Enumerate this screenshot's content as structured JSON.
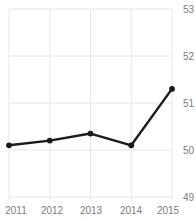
{
  "chart_data": {
    "type": "line",
    "title": "",
    "xlabel": "",
    "ylabel": "",
    "categories": [
      "2011",
      "2012",
      "2013",
      "2014",
      "2015"
    ],
    "x": [
      2011,
      2012,
      2013,
      2014,
      2015
    ],
    "values": [
      50.1,
      50.2,
      50.35,
      50.1,
      51.3
    ],
    "series": [
      {
        "name": "series-1",
        "values": [
          50.1,
          50.2,
          50.35,
          50.1,
          51.3
        ],
        "color": "#1a1a1a",
        "marker": "circle",
        "line_width": 2
      }
    ],
    "ylim": [
      49,
      53
    ],
    "xlim": [
      2011,
      2015
    ],
    "yticks": [
      49,
      50,
      51,
      52,
      53
    ],
    "ytick_labels": [
      "49",
      "50",
      "51",
      "52",
      "53"
    ],
    "xticks": [
      2011,
      2012,
      2013,
      2014,
      2015
    ],
    "xtick_labels": [
      "2011",
      "2012",
      "2013",
      "2014",
      "2015"
    ],
    "grid": true,
    "grid_color": "#e4e4e4",
    "legend": false,
    "legend_position": "none",
    "y_axis_side": "right",
    "background_color": "#ffffff",
    "tick_label_color": "#7d7d7d"
  },
  "axes": {
    "y_labels": [
      "53",
      "52",
      "51",
      "50",
      "49"
    ],
    "x_labels": [
      "2011",
      "2012",
      "2013",
      "2014",
      "2015"
    ]
  }
}
